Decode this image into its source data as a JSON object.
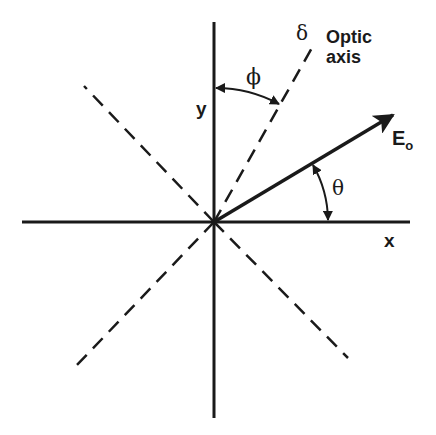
{
  "diagram": {
    "origin": [
      214,
      222
    ],
    "axes": {
      "x_label": "x",
      "y_label": "y"
    },
    "optic_axis": {
      "label_line1": "Optic",
      "label_line2": "axis",
      "phase_symbol": "δ"
    },
    "field_vector": {
      "label": "E",
      "subscript": "o"
    },
    "angles": {
      "phi_symbol": "ϕ",
      "phi_description": "angle between y axis and optic axis",
      "theta_symbol": "θ",
      "theta_description": "angle between x axis and E vector"
    },
    "colors": {
      "ink": "#1a1a1a",
      "background": "#ffffff"
    }
  }
}
